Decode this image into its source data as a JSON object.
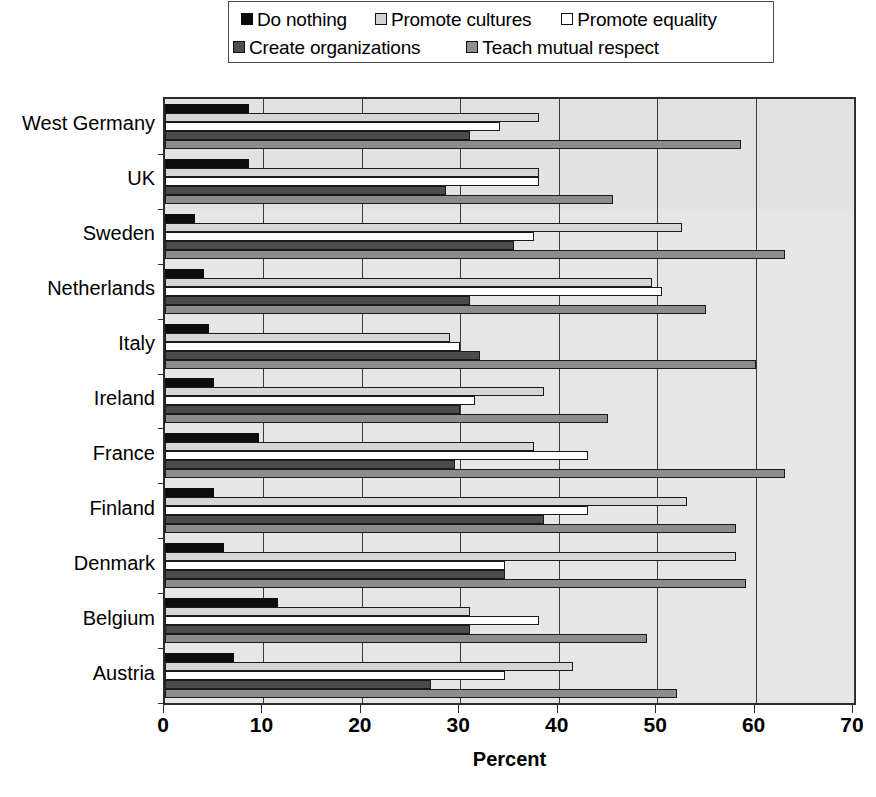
{
  "legend": {
    "entries": [
      {
        "label": "Do nothing",
        "icon": "square-swatch-black",
        "color": "#0d0d0d",
        "key": "sw-do-nothing"
      },
      {
        "label": "Promote cultures",
        "icon": "square-swatch-light-gray",
        "color": "#d6d6d6",
        "key": "sw-promote-cultures"
      },
      {
        "label": "Promote equality",
        "icon": "square-swatch-white",
        "color": "#ffffff",
        "key": "sw-promote-equality"
      },
      {
        "label": "Create organizations",
        "icon": "square-swatch-dark-gray",
        "color": "#4b4b4b",
        "key": "sw-create-orgs"
      },
      {
        "label": "Teach mutual respect",
        "icon": "square-swatch-mid-gray",
        "color": "#8c8c8c",
        "key": "sw-teach-respect"
      }
    ]
  },
  "chart_data": {
    "type": "bar",
    "orientation": "horizontal",
    "title": "",
    "xlabel": "Percent",
    "ylabel": "",
    "xlim": [
      0,
      70
    ],
    "xticks": [
      0,
      10,
      20,
      30,
      40,
      50,
      60,
      70
    ],
    "xticklabels": [
      "0",
      "10",
      "20",
      "30",
      "40",
      "50",
      "60",
      "70"
    ],
    "grid": true,
    "grid_axis": "x",
    "legend_position": "top",
    "categories": [
      "West Germany",
      "UK",
      "Sweden",
      "Netherlands",
      "Italy",
      "Ireland",
      "France",
      "Finland",
      "Denmark",
      "Belgium",
      "Austria"
    ],
    "series": [
      {
        "name": "Do nothing",
        "color": "#0d0d0d",
        "values": [
          8.5,
          8.5,
          3.0,
          4.0,
          4.5,
          5.0,
          9.5,
          5.0,
          6.0,
          11.5,
          7.0
        ]
      },
      {
        "name": "Promote cultures",
        "color": "#d6d6d6",
        "values": [
          38.0,
          38.0,
          52.5,
          49.5,
          29.0,
          38.5,
          37.5,
          53.0,
          58.0,
          31.0,
          41.5
        ]
      },
      {
        "name": "Promote equality",
        "color": "#ffffff",
        "values": [
          34.0,
          38.0,
          37.5,
          50.5,
          30.0,
          31.5,
          43.0,
          43.0,
          34.5,
          38.0,
          34.5
        ]
      },
      {
        "name": "Create organizations",
        "color": "#4b4b4b",
        "values": [
          31.0,
          28.5,
          35.5,
          31.0,
          32.0,
          30.0,
          29.5,
          38.5,
          34.5,
          31.0,
          27.0
        ]
      },
      {
        "name": "Teach mutual respect",
        "color": "#8c8c8c",
        "values": [
          58.5,
          45.5,
          63.0,
          55.0,
          60.0,
          45.0,
          63.0,
          58.0,
          59.0,
          49.0,
          52.0
        ]
      }
    ]
  }
}
